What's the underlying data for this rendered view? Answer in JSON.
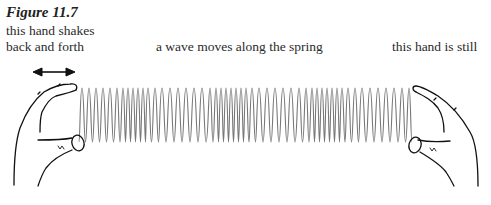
{
  "figure": {
    "title": "Figure 11.7",
    "labels": {
      "left_line1": "this hand shakes",
      "left_line2": "back and forth",
      "middle": "a wave moves along the spring",
      "right": "this hand is still"
    }
  },
  "spring": {
    "x_start": 78,
    "x_end": 414,
    "y_top": 88,
    "y_bottom": 142,
    "color": "#777777",
    "coil_positions": [
      82,
      89,
      96,
      103,
      110,
      117,
      123,
      128,
      133,
      138,
      143,
      148,
      155,
      162,
      170,
      178,
      186,
      194,
      202,
      210,
      216,
      221,
      226,
      231,
      236,
      241,
      246,
      252,
      259,
      267,
      275,
      283,
      291,
      299,
      306,
      312,
      317,
      322,
      327,
      332,
      337,
      342,
      348,
      355,
      362,
      370,
      378,
      386,
      394,
      402,
      409
    ]
  },
  "arrow": {
    "label": "double-headed-arrow",
    "x1": 33,
    "x2": 75,
    "y": 72
  }
}
